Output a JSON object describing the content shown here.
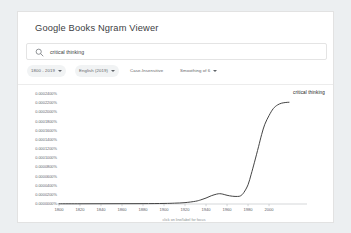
{
  "header": {
    "app_title": "Google Books Ngram Viewer"
  },
  "search": {
    "icon": "search-icon",
    "value": "critical thinking",
    "placeholder": "critical thinking"
  },
  "filters": [
    {
      "name": "date-range",
      "label": "1800 - 2019",
      "has_caret": true,
      "filled": true
    },
    {
      "name": "language",
      "label": "English (2019)",
      "has_caret": true,
      "filled": true
    },
    {
      "name": "case-sensitivity",
      "label": "Case-Insensitive",
      "has_caret": false,
      "filled": false
    },
    {
      "name": "smoothing",
      "label": "Smoothing of 6",
      "has_caret": true,
      "filled": false
    }
  ],
  "chart_footer_hint": "click on line/label for focus",
  "chart_data": {
    "type": "line",
    "title": "",
    "xlabel": "",
    "ylabel": "",
    "xlim": [
      1800,
      2019
    ],
    "ylim": [
      0,
      0.00024
    ],
    "grid": false,
    "legend_position": "right-inline",
    "x_ticks": [
      1800,
      1820,
      1840,
      1860,
      1880,
      1900,
      1920,
      1940,
      1960,
      1980,
      2000
    ],
    "x_tick_labels": [
      "1800",
      "1820",
      "1840",
      "1860",
      "1880",
      "1900",
      "1920",
      "1940",
      "1960",
      "1980",
      "2000"
    ],
    "y_ticks": [
      0.00024,
      0.00022,
      0.0002,
      0.00018,
      0.00016,
      0.00014,
      0.00012,
      0.0001,
      8e-05,
      6e-05,
      4e-05,
      2e-05,
      0.0
    ],
    "y_tick_labels": [
      "0.0002400%",
      "0.0002200%",
      "0.0002000%",
      "0.0001800%",
      "0.0001600%",
      "0.0001400%",
      "0.0001200%",
      "0.0001000%",
      "0.0000800%",
      "0.0000600%",
      "0.0000400%",
      "0.0000200%",
      "0.0000000%"
    ],
    "series": [
      {
        "name": "critical thinking",
        "color": "#3a3a3a",
        "label_at_end": true,
        "x": [
          1800,
          1820,
          1840,
          1860,
          1880,
          1900,
          1910,
          1920,
          1930,
          1935,
          1940,
          1945,
          1950,
          1953,
          1956,
          1960,
          1965,
          1970,
          1973,
          1976,
          1980,
          1983,
          1986,
          1990,
          1993,
          1996,
          2000,
          2004,
          2008,
          2012,
          2016,
          2019
        ],
        "values": [
          5e-07,
          5e-07,
          6e-07,
          7e-07,
          8e-07,
          1.2e-06,
          1.8e-06,
          3e-06,
          6e-06,
          9e-06,
          1.3e-05,
          1.8e-05,
          2.15e-05,
          2.25e-05,
          2.15e-05,
          1.9e-05,
          1.7e-05,
          1.65e-05,
          1.8e-05,
          2.5e-05,
          4.2e-05,
          6.5e-05,
          9e-05,
          0.000125,
          0.000152,
          0.000174,
          0.000193,
          0.000208,
          0.000216,
          0.00022,
          0.0002215,
          0.000222
        ]
      }
    ]
  }
}
